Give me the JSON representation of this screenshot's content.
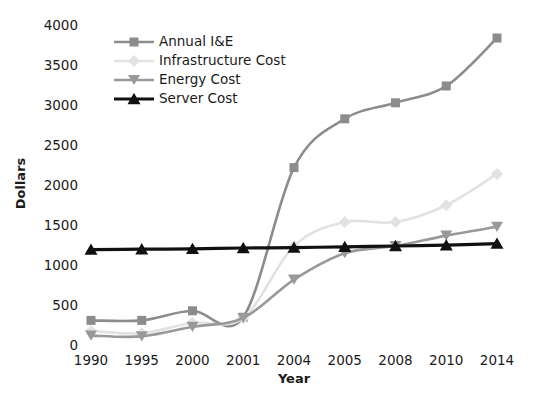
{
  "chart_data": {
    "type": "line",
    "title": "",
    "xlabel": "Year",
    "ylabel": "Dollars",
    "categories": [
      "1990",
      "1995",
      "2000",
      "2001",
      "2004",
      "2005",
      "2008",
      "2010",
      "2014"
    ],
    "ylim": [
      0,
      4000
    ],
    "yticks": [
      0,
      500,
      1000,
      1500,
      2000,
      2500,
      3000,
      3500,
      4000
    ],
    "ytick_labels": [
      "0",
      "500",
      "1000",
      "1500",
      "2000",
      "2500",
      "3000",
      "3500",
      "4000"
    ],
    "grid": false,
    "legend_position": "upper-left-inside",
    "series": [
      {
        "name": "Annual I&E",
        "marker": "square",
        "color": "#8c8c8c",
        "values": [
          320,
          320,
          440,
          360,
          2230,
          2840,
          3040,
          3250,
          3850
        ]
      },
      {
        "name": "Infrastructure Cost",
        "marker": "diamond",
        "color": "#e2e2e2",
        "values": [
          190,
          160,
          290,
          350,
          1250,
          1550,
          1550,
          1760,
          2150
        ]
      },
      {
        "name": "Energy Cost",
        "marker": "triangle-down",
        "color": "#999999",
        "values": [
          130,
          120,
          240,
          350,
          830,
          1160,
          1250,
          1380,
          1490
        ]
      },
      {
        "name": "Server Cost",
        "marker": "triangle-up",
        "color": "#111111",
        "values": [
          1205,
          1210,
          1215,
          1225,
          1230,
          1240,
          1250,
          1260,
          1280
        ]
      }
    ]
  },
  "legend": {
    "items": [
      {
        "label": "Annual I&E"
      },
      {
        "label": "Infrastructure Cost"
      },
      {
        "label": "Energy Cost"
      },
      {
        "label": "Server Cost"
      }
    ]
  }
}
